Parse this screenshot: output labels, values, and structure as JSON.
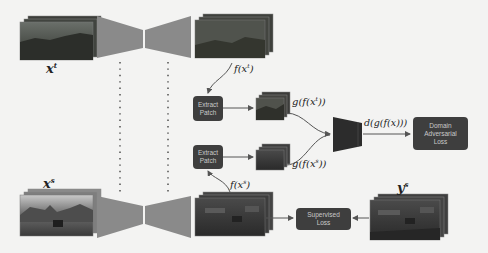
{
  "figure": {
    "labels": {
      "target_input": "x",
      "target_input_sup": "t",
      "source_input": "x",
      "source_input_sup": "s",
      "target_features": "f(x",
      "target_features_sup": "t",
      "target_features_close": ")",
      "source_features": "f(x",
      "source_features_sup": "s",
      "source_features_close": ")",
      "target_patch": "g(f(x",
      "target_patch_sup": "t",
      "target_patch_close": "))",
      "source_patch": "g(f(x",
      "source_patch_sup": "s",
      "source_patch_close": "))",
      "discriminator_output": "d(g(f(x)))",
      "source_label": "y",
      "source_label_sup": "s"
    },
    "boxes": {
      "extract_patch_top": [
        "Extract",
        "Patch"
      ],
      "extract_patch_bottom": [
        "Extract",
        "Patch"
      ],
      "domain_adversarial_loss": [
        "Domain",
        "Adversarial",
        "Loss"
      ],
      "supervised_loss": [
        "Supervised",
        "Loss"
      ]
    },
    "colors": {
      "background": "#f3f3f2",
      "network_fill": "#8a8a8a",
      "discriminator_fill": "#2c2c2c",
      "box_fill": "#3e3e3e",
      "box_text": "#c9c9c9",
      "arrow": "#555555"
    }
  }
}
